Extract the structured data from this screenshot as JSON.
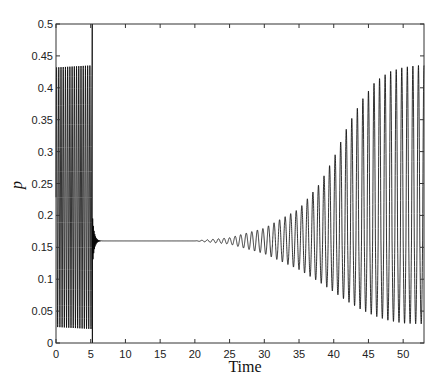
{
  "chart_data": {
    "type": "line",
    "title": "",
    "xlabel": "Time",
    "ylabel": "p",
    "xlim": [
      0,
      53
    ],
    "ylim": [
      0,
      0.5
    ],
    "xticks": [
      0,
      5,
      10,
      15,
      20,
      25,
      30,
      35,
      40,
      45,
      50
    ],
    "yticks": [
      0,
      0.05,
      0.1,
      0.15,
      0.2,
      0.25,
      0.3,
      0.35,
      0.4,
      0.45,
      0.5
    ],
    "ytick_labels": [
      "0",
      "0.05",
      "0.1",
      "0.15",
      "0.2",
      "0.25",
      "0.3",
      "0.35",
      "0.4",
      "0.45",
      "0.5"
    ],
    "grid": false,
    "legend": null,
    "series": [
      {
        "name": "p(t)",
        "color": "#000000",
        "description": "Sustained oscillation 0.022–0.435 for t in [0,5.2]; spike to 0.5 then down to 0 at t≈5.2; damped oscillation settling to 0.16 by t≈7; near-constant 0.16 until t≈20; growing oscillation from t≈22 reaching 0.03–0.435 by t≈50",
        "segments": [
          {
            "t_range": [
              0,
              5.2
            ],
            "min": 0.022,
            "max": 0.435,
            "period": 0.32
          },
          {
            "t_range": [
              5.2,
              5.3
            ],
            "min": 0.0,
            "max": 0.5
          },
          {
            "t_range": [
              5.3,
              7.0
            ],
            "equilibrium": 0.16,
            "damped": true
          },
          {
            "t_range": [
              7.0,
              22.0
            ],
            "equilibrium": 0.16
          },
          {
            "t_range": [
              22.0,
              53.0
            ],
            "equilibrium": 0.16,
            "growing": true,
            "final_min": 0.03,
            "final_max": 0.435,
            "period": 0.8
          }
        ],
        "envelope_upper": [
          [
            20,
            0.16
          ],
          [
            25,
            0.165
          ],
          [
            30,
            0.18
          ],
          [
            35,
            0.21
          ],
          [
            38,
            0.25
          ],
          [
            40,
            0.29
          ],
          [
            42,
            0.34
          ],
          [
            44,
            0.38
          ],
          [
            46,
            0.41
          ],
          [
            48,
            0.425
          ],
          [
            50,
            0.432
          ],
          [
            52,
            0.435
          ]
        ],
        "envelope_lower": [
          [
            20,
            0.16
          ],
          [
            25,
            0.155
          ],
          [
            30,
            0.14
          ],
          [
            35,
            0.115
          ],
          [
            38,
            0.095
          ],
          [
            40,
            0.08
          ],
          [
            42,
            0.065
          ],
          [
            44,
            0.052
          ],
          [
            46,
            0.042
          ],
          [
            48,
            0.035
          ],
          [
            50,
            0.031
          ],
          [
            52,
            0.03
          ]
        ]
      }
    ]
  }
}
